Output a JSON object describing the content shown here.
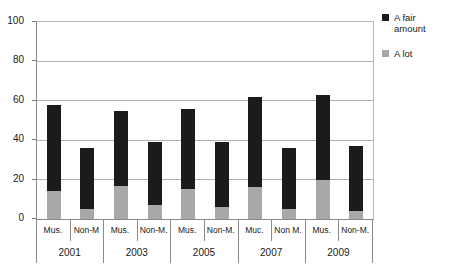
{
  "chart_data": {
    "type": "bar",
    "subtype": "stacked-grouped-column",
    "title": "",
    "xlabel": "",
    "ylabel": "",
    "ylim": [
      0,
      100
    ],
    "yticks": [
      0,
      20,
      40,
      60,
      80,
      100
    ],
    "grid": true,
    "legend_position": "right",
    "groups": [
      "2001",
      "2003",
      "2005",
      "2007",
      "2009"
    ],
    "categories": [
      "Mus.",
      "Non-M",
      "Mus.",
      "Non-M.",
      "Mus.",
      "Non-M.",
      "Muc.",
      "Non M.",
      "Mus.",
      "Non-M."
    ],
    "series": [
      {
        "name": "A lot",
        "color": "#a8a8a8",
        "values": [
          14,
          5,
          17,
          7,
          15,
          6,
          16,
          5,
          20,
          4
        ]
      },
      {
        "name": "A fair amount",
        "color": "#1b1b1b",
        "values": [
          44,
          31,
          38,
          32,
          41,
          33,
          46,
          31,
          43,
          33
        ]
      }
    ],
    "totals": [
      58,
      36,
      55,
      39,
      56,
      39,
      62,
      36,
      63,
      37
    ]
  },
  "legend": {
    "items": [
      {
        "label_line1": "A fair",
        "label_line2": "amount",
        "swatch": "dark-square-icon"
      },
      {
        "label_line1": "A lot",
        "label_line2": "",
        "swatch": "gray-square-icon"
      }
    ]
  },
  "yaxis": {
    "ticks": [
      "100",
      "80",
      "60",
      "40",
      "20",
      "0"
    ]
  }
}
